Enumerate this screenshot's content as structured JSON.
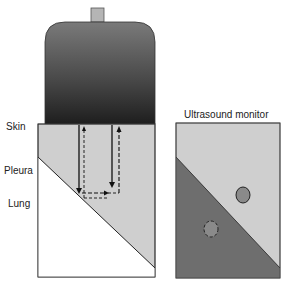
{
  "labels": {
    "skin": "Skin",
    "pleura": "Pleura",
    "lung": "Lung",
    "monitor_title": "Ultrasound monitor"
  },
  "components": {
    "probe": "ultrasound-probe",
    "tissue": "chest-wall-tissue-section",
    "monitor": "ultrasound-monitor-display"
  },
  "arrows": [
    {
      "style": "solid",
      "direction": "down",
      "meaning": "transmitted beam to pleura"
    },
    {
      "style": "dashed",
      "direction": "right",
      "meaning": "reflection along pleura"
    },
    {
      "style": "dashed",
      "direction": "up",
      "meaning": "returned echo to probe"
    },
    {
      "style": "solid",
      "direction": "down",
      "meaning": "transmitted beam"
    }
  ],
  "monitor_objects": [
    {
      "shape": "circle",
      "outline": "solid",
      "region": "light (tissue)"
    },
    {
      "shape": "circle",
      "outline": "dashed",
      "region": "dark (lung) - mirror artifact"
    }
  ],
  "colors": {
    "probe_top": "#3a3a3a",
    "probe_bottom": "#222222",
    "probe_mid": "#6a6a6a",
    "tissue": "#cfcfcf",
    "lung": "#ffffff",
    "monitor_dark": "#6e6e6e",
    "circle_fill": "#8a8a8a",
    "line": "#222222"
  }
}
